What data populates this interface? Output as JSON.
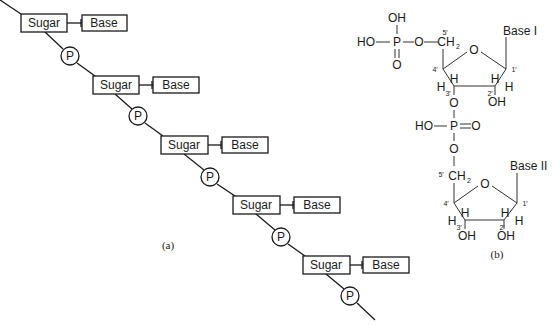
{
  "panel_a": {
    "caption": "(a)",
    "units": [
      {
        "sugar": "Sugar",
        "base": "Base",
        "phosphate": "P"
      },
      {
        "sugar": "Sugar",
        "base": "Base",
        "phosphate": "P"
      },
      {
        "sugar": "Sugar",
        "base": "Base",
        "phosphate": "P"
      },
      {
        "sugar": "Sugar",
        "base": "Base",
        "phosphate": "P"
      },
      {
        "sugar": "Sugar",
        "base": "Base",
        "phosphate": "P"
      }
    ]
  },
  "panel_b": {
    "caption": "(b)",
    "top_phosphate": {
      "oh_top": "OH",
      "ho_left": "HO",
      "p": "P",
      "o_right": "O",
      "o_bottom": "O"
    },
    "nucleotide_1": {
      "base": "Base I",
      "ch2": "CH",
      "ch2_sub": "2",
      "ring_o": "O",
      "c5": "5′",
      "c4": "4′",
      "c3": "3′",
      "c2": "2′",
      "c1": "1′",
      "h": "H",
      "oh": "OH"
    },
    "linker": {
      "o_top": "O",
      "ho": "HO",
      "p": "P",
      "o_double": "O",
      "o_bottom": "O"
    },
    "nucleotide_2": {
      "base": "Base II",
      "ch2": "CH",
      "ch2_sub": "2",
      "ring_o": "O",
      "c5": "5′",
      "c4": "4′",
      "c3": "3′",
      "c2": "2′",
      "c1": "1′",
      "h": "H",
      "oh3": "OH",
      "oh2": "OH"
    }
  }
}
